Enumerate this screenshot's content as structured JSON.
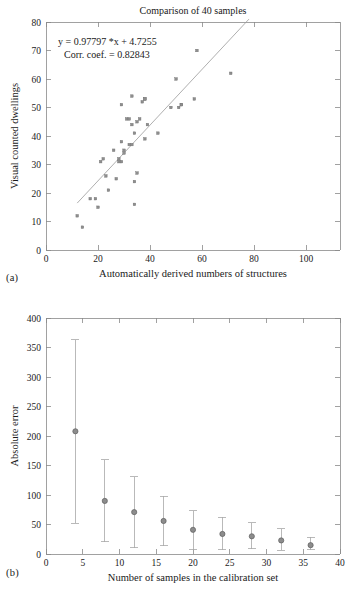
{
  "figure": {
    "panel_a_label": "(a)",
    "panel_b_label": "(b)"
  },
  "chart_data": [
    {
      "id": "panel-a",
      "type": "scatter",
      "title": "Comparison of 40 samples",
      "xlabel": "Automatically derived numbers of structures",
      "ylabel": "Visual counted dwellings",
      "xlim": [
        0,
        113
      ],
      "ylim": [
        0,
        80
      ],
      "xticks": [
        0,
        20,
        40,
        60,
        80,
        100
      ],
      "yticks": [
        0,
        10,
        20,
        30,
        40,
        50,
        60,
        70,
        80
      ],
      "grid": false,
      "legend": "none",
      "annotations": [
        "y = 0.97797 *x + 4.7255",
        "Corr. coef. = 0.82843"
      ],
      "fit": {
        "slope": 0.97797,
        "intercept": 4.7255,
        "corr_coef": 0.82843,
        "x_start": 12,
        "x_end": 78
      },
      "points": [
        {
          "x": 12,
          "y": 12
        },
        {
          "x": 14,
          "y": 8
        },
        {
          "x": 17,
          "y": 18
        },
        {
          "x": 19,
          "y": 18
        },
        {
          "x": 20,
          "y": 15
        },
        {
          "x": 21,
          "y": 31
        },
        {
          "x": 22,
          "y": 32
        },
        {
          "x": 23,
          "y": 26
        },
        {
          "x": 24,
          "y": 21
        },
        {
          "x": 26,
          "y": 35
        },
        {
          "x": 27,
          "y": 25
        },
        {
          "x": 28,
          "y": 31
        },
        {
          "x": 28,
          "y": 32
        },
        {
          "x": 29,
          "y": 31
        },
        {
          "x": 29,
          "y": 38
        },
        {
          "x": 29,
          "y": 51
        },
        {
          "x": 30,
          "y": 34
        },
        {
          "x": 30,
          "y": 35
        },
        {
          "x": 31,
          "y": 46
        },
        {
          "x": 32,
          "y": 37
        },
        {
          "x": 32,
          "y": 46
        },
        {
          "x": 33,
          "y": 37
        },
        {
          "x": 33,
          "y": 54
        },
        {
          "x": 33,
          "y": 44
        },
        {
          "x": 34,
          "y": 16
        },
        {
          "x": 34,
          "y": 24
        },
        {
          "x": 34,
          "y": 41
        },
        {
          "x": 35,
          "y": 27
        },
        {
          "x": 35,
          "y": 45
        },
        {
          "x": 36,
          "y": 46
        },
        {
          "x": 37,
          "y": 52
        },
        {
          "x": 38,
          "y": 53
        },
        {
          "x": 38,
          "y": 53
        },
        {
          "x": 38,
          "y": 39
        },
        {
          "x": 39,
          "y": 44
        },
        {
          "x": 43,
          "y": 41
        },
        {
          "x": 48,
          "y": 50
        },
        {
          "x": 50,
          "y": 60
        },
        {
          "x": 51,
          "y": 50
        },
        {
          "x": 52,
          "y": 51
        },
        {
          "x": 52,
          "y": 51
        },
        {
          "x": 57,
          "y": 53
        },
        {
          "x": 58,
          "y": 70
        },
        {
          "x": 71,
          "y": 62
        }
      ]
    },
    {
      "id": "panel-b",
      "type": "errorbar",
      "title": "",
      "xlabel": "Number of samples in the calibration set",
      "ylabel": "Absolute error",
      "xlim": [
        0,
        40
      ],
      "ylim": [
        0,
        400
      ],
      "xticks": [
        0,
        5,
        10,
        15,
        20,
        25,
        30,
        35,
        40
      ],
      "yticks": [
        0,
        50,
        100,
        150,
        200,
        250,
        300,
        350,
        400
      ],
      "grid": false,
      "legend": "none",
      "x": [
        4,
        8,
        12,
        16,
        20,
        24,
        28,
        32,
        36
      ],
      "values": [
        208,
        90,
        71,
        56,
        41,
        34,
        30,
        23,
        15
      ],
      "err_low": [
        52,
        21,
        11,
        14,
        8,
        7,
        9,
        6,
        7
      ],
      "err_high": [
        363,
        160,
        131,
        98,
        73,
        62,
        53,
        43,
        28
      ]
    }
  ]
}
